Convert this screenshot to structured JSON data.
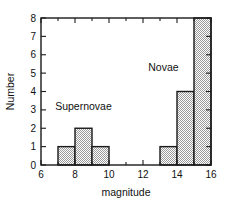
{
  "chart_data": {
    "type": "bar",
    "title": "",
    "subtitle": "",
    "xlabel": "magnitude",
    "ylabel": "Number",
    "xlim": [
      6,
      16
    ],
    "ylim": [
      0,
      8
    ],
    "grid": false,
    "legend_position": "inline-annotations",
    "bin_width": 1,
    "x_major_ticks": [
      6,
      8,
      10,
      12,
      14,
      16
    ],
    "x_minor_ticks": [
      7,
      9,
      11,
      13,
      15
    ],
    "x_tick_labels": [
      "6",
      "8",
      "10",
      "12",
      "14",
      "16"
    ],
    "y_ticks": [
      0,
      1,
      2,
      3,
      4,
      5,
      6,
      7,
      8
    ],
    "y_tick_labels": [
      "0",
      "1",
      "2",
      "3",
      "4",
      "5",
      "6",
      "7",
      "8"
    ],
    "annotations": [
      {
        "text": "Supernovae",
        "x": 8.5,
        "y": 3.0
      },
      {
        "text": "Novae",
        "x": 13.2,
        "y": 5.1
      }
    ],
    "series": [
      {
        "name": "Supernovae",
        "bins": [
          {
            "x0": 7,
            "x1": 8,
            "value": 1
          },
          {
            "x0": 8,
            "x1": 9,
            "value": 2
          },
          {
            "x0": 9,
            "x1": 10,
            "value": 1
          }
        ]
      },
      {
        "name": "Novae",
        "bins": [
          {
            "x0": 13,
            "x1": 14,
            "value": 1
          },
          {
            "x0": 14,
            "x1": 15,
            "value": 4
          },
          {
            "x0": 15,
            "x1": 16,
            "value": 8
          }
        ]
      }
    ],
    "categories": [
      "7-8",
      "8-9",
      "9-10",
      "13-14",
      "14-15",
      "15-16"
    ],
    "values": [
      1,
      2,
      1,
      1,
      4,
      8
    ],
    "colors": {
      "bar_fill": "#cccccc",
      "bar_stroke": "#1a1a1a",
      "axis": "#1a1a1a",
      "background": "#ffffff",
      "text": "#111111"
    }
  }
}
